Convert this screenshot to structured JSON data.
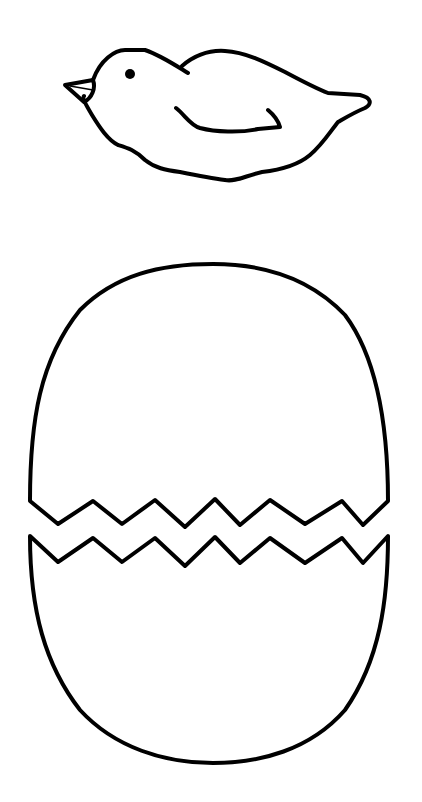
{
  "page": {
    "background": "#ffffff",
    "ink_color": "#000000"
  },
  "figures": [
    {
      "name": "chick",
      "description": "Outline of a baby chick lying down, facing left, with eye, beak and wing"
    },
    {
      "name": "egg-top-shell",
      "description": "Upper half of cracked egg shell with zigzag bottom edge"
    },
    {
      "name": "egg-bottom-shell",
      "description": "Lower half of cracked egg shell with zigzag top edge"
    }
  ]
}
